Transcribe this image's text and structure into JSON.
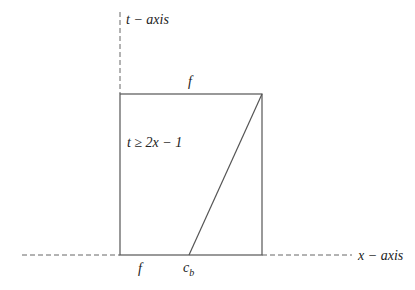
{
  "diagram": {
    "axes": {
      "t_axis_label": "t − axis",
      "x_axis_label": "x − axis"
    },
    "labels": {
      "top_edge": "f",
      "bottom_left": "f",
      "bottom_point": "c",
      "bottom_point_sub": "b",
      "region": "t ≥ 2x − 1"
    },
    "colors": {
      "line": "#555555",
      "text": "#222222"
    }
  }
}
